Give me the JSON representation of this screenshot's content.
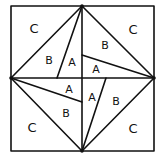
{
  "diagram": {
    "labels": {
      "top_left": {
        "c": "C",
        "b": "B",
        "a": "A"
      },
      "top_right": {
        "c": "C",
        "b": "B",
        "a": "A"
      },
      "bottom_left": {
        "c": "C",
        "b": "B",
        "a": "A"
      },
      "bottom_right": {
        "c": "C",
        "b": "B",
        "a": "A"
      }
    },
    "stroke_color": "#111111",
    "background_color": "#ffffff"
  }
}
